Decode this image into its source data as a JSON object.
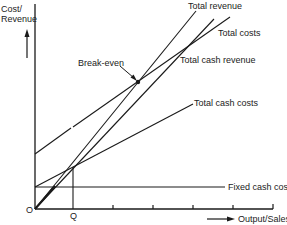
{
  "diagram": {
    "type": "break-even chart",
    "y_axis_label_line1": "Cost/",
    "y_axis_label_line2": "Revenue",
    "x_axis_label": "Output/Sales",
    "origin_label": "O",
    "q_label": "Q",
    "lines": {
      "total_revenue": "Total revenue",
      "total_costs": "Total costs",
      "total_cash_revenue": "Total cash revenue",
      "total_cash_costs": "Total cash costs",
      "fixed_cash_costs": "Fixed cash costs"
    },
    "annotation": "Break-even",
    "colors": {
      "line": "#1a1a1a",
      "background": "#ffffff"
    }
  }
}
